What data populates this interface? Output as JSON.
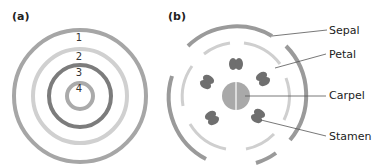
{
  "panels": {
    "a": {
      "label": "(a)",
      "rings": [
        "1",
        "2",
        "3",
        "4"
      ]
    },
    "b": {
      "label": "(b)",
      "parts": [
        "Sepal",
        "Petal",
        "Carpel",
        "Stamen"
      ]
    }
  },
  "colors": {
    "ring1": "#a6a6a6",
    "ring2": "#d0d0d0",
    "ring3": "#7c7c7c",
    "ring4": "#aaaaaa",
    "stamen": "#6f6f6f",
    "carpel": "#a9a9a9"
  }
}
